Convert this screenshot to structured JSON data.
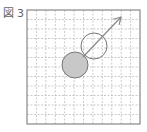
{
  "figure": {
    "label_prefix": "図",
    "label_number": "3"
  },
  "grid": {
    "columns": 12,
    "rows": 12,
    "x": 27,
    "y": 10,
    "width": 113,
    "height": 114,
    "line_color": "#bdbdbd",
    "border_color": "#888888"
  },
  "shapes": {
    "filled_circle": {
      "cx": 75,
      "cy": 65,
      "r": 13,
      "fill": "#c8c8c8",
      "stroke": "#777777"
    },
    "open_circle": {
      "cx": 94,
      "cy": 46,
      "r": 13,
      "fill": "none",
      "stroke": "#777777"
    },
    "arrow": {
      "x1": 83,
      "y1": 57,
      "x2": 121,
      "y2": 17,
      "stroke": "#888888"
    }
  }
}
